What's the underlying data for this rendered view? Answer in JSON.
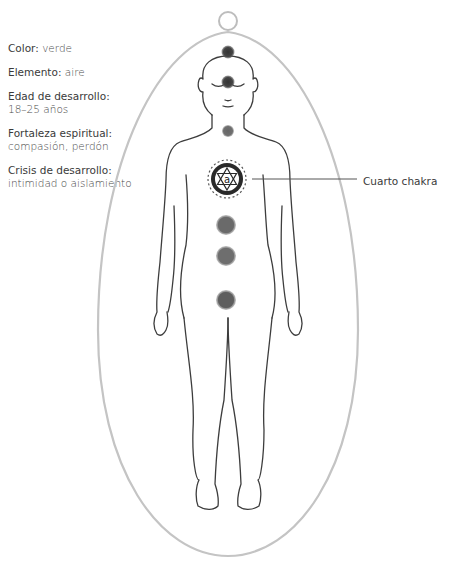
{
  "info_panel": {
    "items": [
      {
        "label": "Color:",
        "value": "verde",
        "inline": true
      },
      {
        "label": "Elemento:",
        "value": "aire",
        "inline": true
      },
      {
        "label": "Edad de desarrollo:",
        "value": "18–25 años",
        "inline": false
      },
      {
        "label": "Fortaleza espiritual:",
        "value": "compasión, perdón",
        "inline": false
      },
      {
        "label": "Crisis de desarrollo:",
        "value": "intimidad o aislamiento",
        "inline": false
      }
    ]
  },
  "callout": {
    "label": "Cuarto chakra"
  },
  "figure": {
    "highlighted_chakra": "heart",
    "mandala_glyph": "a",
    "colors": {
      "aura": "#c8c8c8",
      "body_outline": "#3d3d3d",
      "chakra_dark": "#4a4a4a",
      "chakra_mid": "#6e6e6e",
      "chakra_light": "#808080"
    }
  }
}
